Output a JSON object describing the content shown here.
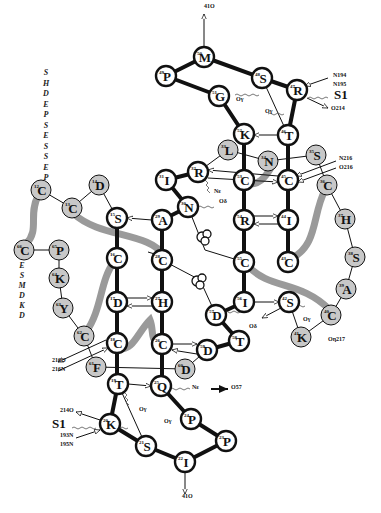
{
  "diagram": {
    "nodes": [
      {
        "id": "M50",
        "num": "50",
        "aa": "M",
        "x": 204,
        "y": 57,
        "shaded": false
      },
      {
        "id": "P49",
        "num": "49",
        "aa": "P",
        "x": 166,
        "y": 76,
        "shaded": false
      },
      {
        "id": "S48",
        "num": "48",
        "aa": "S",
        "x": 262,
        "y": 78,
        "shaded": false
      },
      {
        "id": "G51",
        "num": "51",
        "aa": "G",
        "x": 219,
        "y": 96,
        "shaded": false
      },
      {
        "id": "R47",
        "num": "47",
        "aa": "R",
        "x": 297,
        "y": 90,
        "shaded": false
      },
      {
        "id": "K52",
        "num": "52",
        "aa": "K",
        "x": 244,
        "y": 134,
        "shaded": false
      },
      {
        "id": "T46",
        "num": "46",
        "aa": "T",
        "x": 288,
        "y": 135,
        "shaded": false
      },
      {
        "id": "L33",
        "num": "33",
        "aa": "L",
        "x": 228,
        "y": 150,
        "shaded": true
      },
      {
        "id": "N34",
        "num": "34",
        "aa": "N",
        "x": 268,
        "y": 161,
        "shaded": true
      },
      {
        "id": "S35",
        "num": "35",
        "aa": "S",
        "x": 316,
        "y": 155,
        "shaded": true
      },
      {
        "id": "I31",
        "num": "31",
        "aa": "I",
        "x": 166,
        "y": 180,
        "shaded": false
      },
      {
        "id": "R32",
        "num": "32",
        "aa": "R",
        "x": 198,
        "y": 172,
        "shaded": false
      },
      {
        "id": "C53",
        "num": "53",
        "aa": "C",
        "x": 244,
        "y": 180,
        "shaded": false
      },
      {
        "id": "C45",
        "num": "45",
        "aa": "C",
        "x": 288,
        "y": 180,
        "shaded": false
      },
      {
        "id": "C36",
        "num": "36",
        "aa": "C",
        "x": 327,
        "y": 185,
        "shaded": true
      },
      {
        "id": "N30",
        "num": "30",
        "aa": "N",
        "x": 188,
        "y": 207,
        "shaded": false
      },
      {
        "id": "A29",
        "num": "29",
        "aa": "A",
        "x": 162,
        "y": 220,
        "shaded": false
      },
      {
        "id": "S15",
        "num": "15",
        "aa": "S",
        "x": 117,
        "y": 218,
        "shaded": false
      },
      {
        "id": "R54",
        "num": "54",
        "aa": "R",
        "x": 244,
        "y": 220,
        "shaded": false
      },
      {
        "id": "I44",
        "num": "44",
        "aa": "I",
        "x": 288,
        "y": 220,
        "shaded": false
      },
      {
        "id": "H37",
        "num": "37",
        "aa": "H",
        "x": 345,
        "y": 219,
        "shaded": true
      },
      {
        "id": "C16",
        "num": "16",
        "aa": "C",
        "x": 117,
        "y": 258,
        "shaded": false
      },
      {
        "id": "C28",
        "num": "28",
        "aa": "C",
        "x": 162,
        "y": 260,
        "shaded": false
      },
      {
        "id": "C55",
        "num": "55",
        "aa": "C",
        "x": 244,
        "y": 262,
        "shaded": false
      },
      {
        "id": "C43",
        "num": "43",
        "aa": "C",
        "x": 288,
        "y": 262,
        "shaded": false
      },
      {
        "id": "S38",
        "num": "38",
        "aa": "S",
        "x": 355,
        "y": 257,
        "shaded": true
      },
      {
        "id": "A39",
        "num": "39",
        "aa": "A",
        "x": 346,
        "y": 289,
        "shaded": true
      },
      {
        "id": "D17",
        "num": "17",
        "aa": "D",
        "x": 117,
        "y": 302,
        "shaded": false
      },
      {
        "id": "H27",
        "num": "27",
        "aa": "H",
        "x": 162,
        "y": 302,
        "shaded": false
      },
      {
        "id": "I56",
        "num": "56",
        "aa": "I",
        "x": 244,
        "y": 302,
        "shaded": false
      },
      {
        "id": "S42",
        "num": "42",
        "aa": "S",
        "x": 289,
        "y": 302,
        "shaded": false
      },
      {
        "id": "D57",
        "num": "57",
        "aa": "D",
        "x": 216,
        "y": 315,
        "shaded": false
      },
      {
        "id": "C40",
        "num": "40",
        "aa": "C",
        "x": 331,
        "y": 315,
        "shaded": true
      },
      {
        "id": "T58",
        "num": "58",
        "aa": "T",
        "x": 239,
        "y": 341,
        "shaded": false
      },
      {
        "id": "K41",
        "num": "41",
        "aa": "K",
        "x": 301,
        "y": 337,
        "shaded": true
      },
      {
        "id": "C62",
        "num": "62",
        "aa": "C",
        "x": 84,
        "y": 336,
        "shaded": true
      },
      {
        "id": "C18",
        "num": "18",
        "aa": "C",
        "x": 117,
        "y": 343,
        "shaded": false
      },
      {
        "id": "C26",
        "num": "26",
        "aa": "C",
        "x": 162,
        "y": 344,
        "shaded": false
      },
      {
        "id": "D59",
        "num": "59",
        "aa": "D",
        "x": 207,
        "y": 350,
        "shaded": false
      },
      {
        "id": "F61",
        "num": "61",
        "aa": "F",
        "x": 96,
        "y": 367,
        "shaded": true
      },
      {
        "id": "D60",
        "num": "60",
        "aa": "D",
        "x": 185,
        "y": 369,
        "shaded": true
      },
      {
        "id": "T19",
        "num": "19",
        "aa": "T",
        "x": 118,
        "y": 384,
        "shaded": false
      },
      {
        "id": "Q25",
        "num": "25",
        "aa": "Q",
        "x": 161,
        "y": 386,
        "shaded": false
      },
      {
        "id": "K20",
        "num": "20",
        "aa": "K",
        "x": 110,
        "y": 424,
        "shaded": false
      },
      {
        "id": "P24",
        "num": "24",
        "aa": "P",
        "x": 191,
        "y": 419,
        "shaded": false
      },
      {
        "id": "S21",
        "num": "21",
        "aa": "S",
        "x": 146,
        "y": 446,
        "shaded": false
      },
      {
        "id": "P23",
        "num": "23",
        "aa": "P",
        "x": 226,
        "y": 441,
        "shaded": false
      },
      {
        "id": "I22",
        "num": "22",
        "aa": "I",
        "x": 185,
        "y": 462,
        "shaded": false
      },
      {
        "id": "C12",
        "num": "12",
        "aa": "C",
        "x": 41,
        "y": 190,
        "shaded": true
      },
      {
        "id": "D14",
        "num": "14",
        "aa": "D",
        "x": 99,
        "y": 185,
        "shaded": true
      },
      {
        "id": "C13",
        "num": "13",
        "aa": "C",
        "x": 72,
        "y": 208,
        "shaded": true
      },
      {
        "id": "C66",
        "num": "66",
        "aa": "C",
        "x": 24,
        "y": 250,
        "shaded": true
      },
      {
        "id": "P65",
        "num": "65",
        "aa": "P",
        "x": 59,
        "y": 250,
        "shaded": true
      },
      {
        "id": "K64",
        "num": "64",
        "aa": "K",
        "x": 59,
        "y": 278,
        "shaded": true
      },
      {
        "id": "Y63",
        "num": "63",
        "aa": "Y",
        "x": 63,
        "y": 308,
        "shaded": true
      }
    ],
    "sequences": {
      "top_left": [
        "S",
        "H",
        "D",
        "E",
        "P",
        "S",
        "E",
        "S",
        "S",
        "E",
        "P"
      ],
      "left_mid": [
        "E",
        "S",
        "M",
        "D",
        "K",
        "D"
      ]
    },
    "annotations": [
      {
        "text": "41O",
        "x": 204,
        "y": 8
      },
      {
        "text": "N194",
        "x": 333,
        "y": 77
      },
      {
        "text": "N195",
        "x": 333,
        "y": 86
      },
      {
        "text": "S1",
        "x": 334,
        "y": 99,
        "big": true
      },
      {
        "text": "O214",
        "x": 331,
        "y": 110
      },
      {
        "text": "Oγ",
        "x": 236,
        "y": 101
      },
      {
        "text": "Oγ",
        "x": 265,
        "y": 113
      },
      {
        "text": "N216",
        "x": 339,
        "y": 160
      },
      {
        "text": "O216",
        "x": 339,
        "y": 169
      },
      {
        "text": "Nε",
        "x": 214,
        "y": 193
      },
      {
        "text": "Oδ",
        "x": 219,
        "y": 203
      },
      {
        "text": "Oδ",
        "x": 249,
        "y": 328
      },
      {
        "text": "Oγ",
        "x": 303,
        "y": 321
      },
      {
        "text": "Oη217",
        "x": 328,
        "y": 341
      },
      {
        "text": "216O",
        "x": 52,
        "y": 362
      },
      {
        "text": "216N",
        "x": 52,
        "y": 371
      },
      {
        "text": "Nε",
        "x": 192,
        "y": 389
      },
      {
        "text": "O57",
        "x": 231,
        "y": 389
      },
      {
        "text": "Oγ",
        "x": 139,
        "y": 411
      },
      {
        "text": "Oγ",
        "x": 164,
        "y": 423
      },
      {
        "text": "214O",
        "x": 60,
        "y": 412
      },
      {
        "text": "S1",
        "x": 52,
        "y": 428,
        "big": true
      },
      {
        "text": "193N",
        "x": 60,
        "y": 437
      },
      {
        "text": "195N",
        "x": 60,
        "y": 446
      },
      {
        "text": "41O",
        "x": 182,
        "y": 498
      }
    ]
  }
}
